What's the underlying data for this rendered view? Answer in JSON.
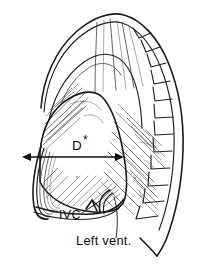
{
  "figure": {
    "background_color": "#ffffff",
    "ink_color": "#1a1a1a"
  },
  "labels": {
    "diameter": {
      "text": "D",
      "superscript": "*",
      "name": "diaphragm-diameter-label",
      "x": 72,
      "y": 150
    },
    "ivc": {
      "text": "IVC",
      "name": "inferior-vena-cava-label",
      "x": 59,
      "y": 219
    },
    "left_ventricle": {
      "text": "Left vent.",
      "name": "left-ventricle-label",
      "x": 76,
      "y": 245
    }
  },
  "measurement": {
    "name": "diameter-arrow",
    "type": "double-headed-arrow",
    "x_start": 23,
    "x_end": 123,
    "y": 157,
    "length_px": 100
  },
  "structures": [
    {
      "name": "thoracic-outline",
      "kind": "outline"
    },
    {
      "name": "lung-field",
      "kind": "region"
    },
    {
      "name": "rib-notches",
      "kind": "series",
      "count": 12
    },
    {
      "name": "diaphragm-dome",
      "kind": "curve"
    },
    {
      "name": "cardiac-silhouette",
      "kind": "region"
    },
    {
      "name": "costophrenic-angle",
      "kind": "region"
    },
    {
      "name": "inferior-vena-cava",
      "kind": "curve"
    },
    {
      "name": "left-ventricle-border",
      "kind": "curve"
    }
  ],
  "leader_lines": [
    {
      "name": "ivc-leader",
      "from_x": 82,
      "from_y": 213,
      "to_x": 101,
      "to_y": 202
    },
    {
      "name": "left-vent-leader",
      "from_x": 115,
      "from_y": 238,
      "to_x": 122,
      "to_y": 196
    }
  ]
}
